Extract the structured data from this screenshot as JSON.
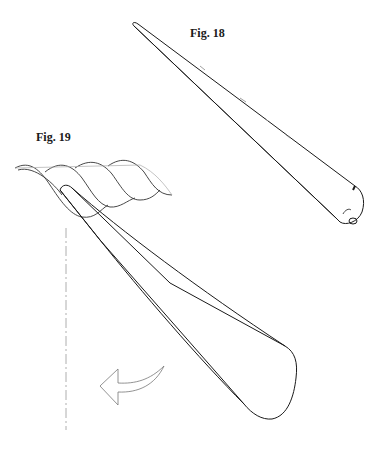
{
  "figures": [
    {
      "label": "Fig. 18",
      "subject": "tapered pointed tool (fid / marlinspike) drawn diagonally"
    },
    {
      "label": "Fig. 19",
      "subject": "tool inserted between rope strands with rotation arrow"
    }
  ],
  "colors": {
    "ink": "#1a1a1a",
    "light_ink": "#888888",
    "background": "#ffffff"
  }
}
